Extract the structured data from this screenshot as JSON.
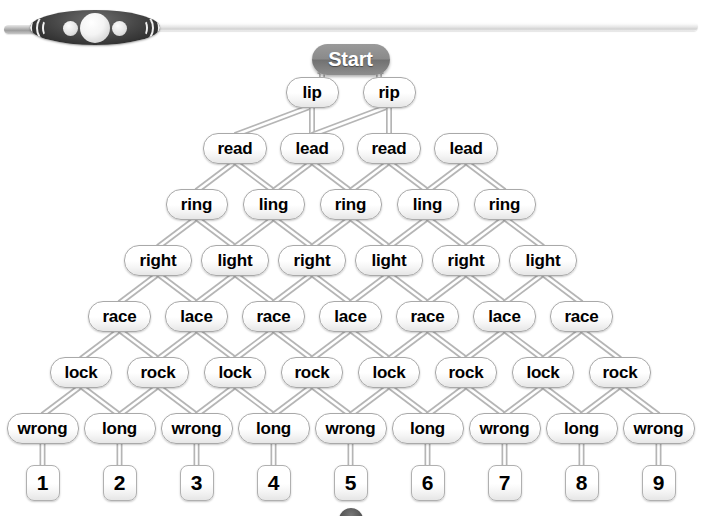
{
  "decoration": {
    "rod_name": "bead-rod-ornament",
    "bead_color": "#2e2e2e",
    "rod_color": "#e6e6e6"
  },
  "colors": {
    "start_node_fill": "#8a8a8a",
    "start_node_text": "#ffffff",
    "node_fill": "#ffffff",
    "node_border": "#a9a9a9",
    "node_text": "#000000",
    "link_stroke": "#b5b5b5",
    "background": "#ffffff"
  },
  "tree": {
    "root": {
      "label": "Start"
    },
    "levels": [
      {
        "level": 1,
        "nodes": [
          {
            "label": "lip"
          },
          {
            "label": "rip"
          }
        ]
      },
      {
        "level": 2,
        "nodes": [
          {
            "label": "read"
          },
          {
            "label": "lead"
          },
          {
            "label": "read"
          },
          {
            "label": "lead"
          }
        ]
      },
      {
        "level": 3,
        "nodes": [
          {
            "label": "ring"
          },
          {
            "label": "ling"
          },
          {
            "label": "ring"
          },
          {
            "label": "ling"
          },
          {
            "label": "ring"
          }
        ]
      },
      {
        "level": 4,
        "nodes": [
          {
            "label": "right"
          },
          {
            "label": "light"
          },
          {
            "label": "right"
          },
          {
            "label": "light"
          },
          {
            "label": "right"
          },
          {
            "label": "light"
          }
        ]
      },
      {
        "level": 5,
        "nodes": [
          {
            "label": "race"
          },
          {
            "label": "lace"
          },
          {
            "label": "race"
          },
          {
            "label": "lace"
          },
          {
            "label": "race"
          },
          {
            "label": "lace"
          },
          {
            "label": "race"
          }
        ]
      },
      {
        "level": 6,
        "nodes": [
          {
            "label": "lock"
          },
          {
            "label": "rock"
          },
          {
            "label": "lock"
          },
          {
            "label": "rock"
          },
          {
            "label": "lock"
          },
          {
            "label": "rock"
          },
          {
            "label": "lock"
          },
          {
            "label": "rock"
          }
        ]
      },
      {
        "level": 7,
        "nodes": [
          {
            "label": "wrong"
          },
          {
            "label": "long"
          },
          {
            "label": "wrong"
          },
          {
            "label": "long"
          },
          {
            "label": "wrong"
          },
          {
            "label": "long"
          },
          {
            "label": "wrong"
          },
          {
            "label": "long"
          },
          {
            "label": "wrong"
          }
        ]
      },
      {
        "level": 8,
        "nodes": [
          {
            "label": "1"
          },
          {
            "label": "2"
          },
          {
            "label": "3"
          },
          {
            "label": "4"
          },
          {
            "label": "5"
          },
          {
            "label": "6"
          },
          {
            "label": "7"
          },
          {
            "label": "8"
          },
          {
            "label": "9"
          }
        ]
      }
    ]
  }
}
